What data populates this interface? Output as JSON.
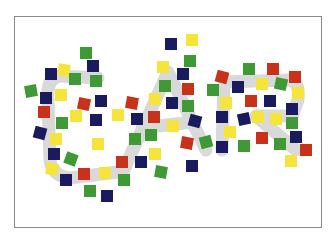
{
  "illustration": {
    "word": "CAR",
    "description": "The word CAR drawn as a light gray outline, covered with scattered colored squares",
    "colors": {
      "navy": "#1a1a5e",
      "red": "#c8321a",
      "green": "#3f9a35",
      "yellow": "#f7e43a",
      "letter_gray": "#d9d9d9",
      "frame": "#8a8a8a"
    },
    "squares": [
      [
        86,
        53,
        "green",
        0
      ],
      [
        93,
        66,
        "navy",
        0
      ],
      [
        64,
        70,
        "yellow",
        8
      ],
      [
        51,
        74,
        "navy",
        0
      ],
      [
        75,
        79,
        "green",
        0
      ],
      [
        96,
        81,
        "green",
        0
      ],
      [
        31,
        91,
        "green",
        -10
      ],
      [
        46,
        98,
        "navy",
        0
      ],
      [
        61,
        95,
        "yellow",
        0
      ],
      [
        84,
        104,
        "red",
        12
      ],
      [
        101,
        101,
        "navy",
        0
      ],
      [
        44,
        112,
        "red",
        0
      ],
      [
        76,
        116,
        "yellow",
        0
      ],
      [
        96,
        120,
        "navy",
        0
      ],
      [
        62,
        123,
        "green",
        0
      ],
      [
        40,
        133,
        "navy",
        15
      ],
      [
        56,
        139,
        "yellow",
        0
      ],
      [
        98,
        144,
        "yellow",
        0
      ],
      [
        54,
        154,
        "navy",
        0
      ],
      [
        71,
        159,
        "green",
        20
      ],
      [
        52,
        169,
        "yellow",
        10
      ],
      [
        84,
        174,
        "red",
        0
      ],
      [
        105,
        173,
        "yellow",
        0
      ],
      [
        66,
        180,
        "navy",
        0
      ],
      [
        90,
        191,
        "green",
        0
      ],
      [
        107,
        196,
        "navy",
        0
      ],
      [
        171,
        44,
        "navy",
        0
      ],
      [
        192,
        40,
        "yellow",
        0
      ],
      [
        190,
        61,
        "green",
        0
      ],
      [
        163,
        67,
        "yellow",
        0
      ],
      [
        183,
        74,
        "navy",
        0
      ],
      [
        165,
        86,
        "green",
        0
      ],
      [
        188,
        89,
        "red",
        0
      ],
      [
        132,
        103,
        "red",
        10
      ],
      [
        155,
        99,
        "yellow",
        0
      ],
      [
        172,
        103,
        "navy",
        0
      ],
      [
        188,
        106,
        "green",
        0
      ],
      [
        118,
        115,
        "yellow",
        0
      ],
      [
        137,
        119,
        "navy",
        0
      ],
      [
        154,
        117,
        "red",
        0
      ],
      [
        173,
        126,
        "yellow",
        0
      ],
      [
        195,
        121,
        "navy",
        15
      ],
      [
        135,
        139,
        "green",
        0
      ],
      [
        151,
        135,
        "green",
        0
      ],
      [
        187,
        143,
        "red",
        10
      ],
      [
        206,
        142,
        "green",
        -15
      ],
      [
        122,
        162,
        "red",
        0
      ],
      [
        141,
        162,
        "navy",
        0
      ],
      [
        155,
        154,
        "yellow",
        0
      ],
      [
        124,
        180,
        "green",
        0
      ],
      [
        161,
        172,
        "green",
        10
      ],
      [
        192,
        166,
        "navy",
        0
      ],
      [
        222,
        77,
        "red",
        15
      ],
      [
        249,
        69,
        "green",
        0
      ],
      [
        273,
        69,
        "red",
        0
      ],
      [
        295,
        77,
        "red",
        0
      ],
      [
        213,
        90,
        "green",
        0
      ],
      [
        238,
        87,
        "navy",
        0
      ],
      [
        262,
        84,
        "yellow",
        0
      ],
      [
        281,
        84,
        "green",
        12
      ],
      [
        298,
        93,
        "yellow",
        0
      ],
      [
        226,
        103,
        "yellow",
        0
      ],
      [
        251,
        101,
        "red",
        0
      ],
      [
        270,
        101,
        "navy",
        0
      ],
      [
        292,
        109,
        "navy",
        0
      ],
      [
        222,
        117,
        "navy",
        0
      ],
      [
        244,
        119,
        "navy",
        -12
      ],
      [
        258,
        117,
        "yellow",
        0
      ],
      [
        276,
        119,
        "yellow",
        0
      ],
      [
        292,
        123,
        "green",
        0
      ],
      [
        230,
        132,
        "yellow",
        0
      ],
      [
        262,
        138,
        "red",
        0
      ],
      [
        296,
        137,
        "navy",
        0
      ],
      [
        222,
        147,
        "navy",
        0
      ],
      [
        244,
        146,
        "green",
        0
      ],
      [
        280,
        144,
        "green",
        0
      ],
      [
        306,
        150,
        "red",
        0
      ],
      [
        291,
        161,
        "yellow",
        0
      ]
    ]
  }
}
